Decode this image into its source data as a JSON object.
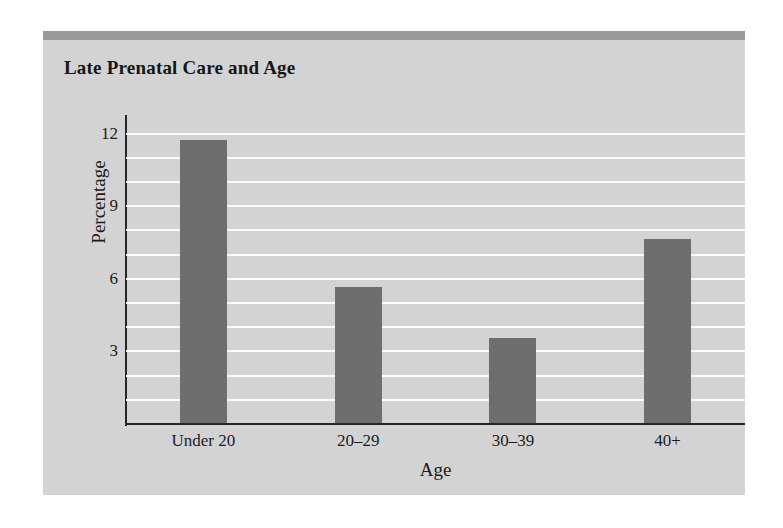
{
  "figure": {
    "title": "Late Prenatal Care and Age",
    "panel_color": "#d3d3d3",
    "band_color": "#9a9a9a",
    "bar_color": "#6e6e6e",
    "gridline_color": "#fbfbfb",
    "axis_color": "#262626"
  },
  "chart_data": {
    "type": "bar",
    "title": "Late Prenatal Care and Age",
    "xlabel": "Age",
    "ylabel": "Percentage",
    "categories": [
      "Under 20",
      "20–29",
      "30–39",
      "40+"
    ],
    "values": [
      11.7,
      5.6,
      3.5,
      7.6
    ],
    "ylim": [
      0,
      12.0
    ],
    "ytick_labels": [
      "3",
      "6",
      "9",
      "12"
    ],
    "ytick_values": [
      3,
      6,
      9,
      12
    ],
    "gridlines": {
      "visible": true,
      "orientation": "horizontal",
      "step": 1,
      "values": [
        1,
        2,
        3,
        4,
        5,
        6,
        7,
        8,
        9,
        10,
        11,
        12
      ],
      "color": "#fbfbfb"
    },
    "legend": null,
    "series": [
      {
        "name": "Percentage with late prenatal care",
        "values": [
          11.7,
          5.6,
          3.5,
          7.6
        ]
      }
    ]
  }
}
